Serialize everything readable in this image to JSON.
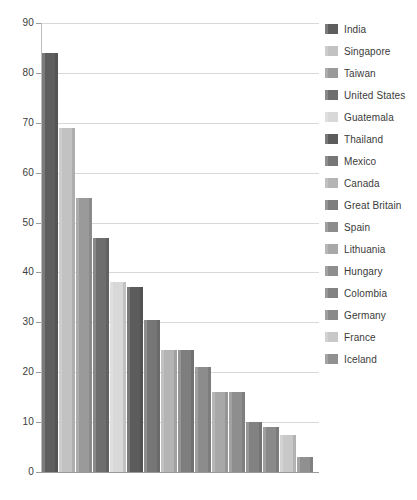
{
  "chart_data": {
    "type": "bar",
    "title": "",
    "subtitle": "",
    "xlabel": "",
    "ylabel": "",
    "ylim": [
      0,
      90
    ],
    "ytick_labels": [
      "90",
      "80",
      "70",
      "60",
      "50",
      "40",
      "30",
      "20",
      "10",
      "0"
    ],
    "yticks": [
      90,
      80,
      70,
      60,
      50,
      40,
      30,
      20,
      10,
      0
    ],
    "grid": true,
    "legend_position": "right",
    "categories": [
      "India",
      "Singapore",
      "Taiwan",
      "United States",
      "Guatemala",
      "Thailand",
      "Mexico",
      "Canada",
      "Great Britain",
      "Spain",
      "Lithuania",
      "Hungary",
      "Colombia",
      "Germany",
      "France",
      "Iceland"
    ],
    "values": [
      84,
      69,
      55,
      47,
      38,
      37,
      30.5,
      24.5,
      24.5,
      21,
      16,
      16,
      10,
      9,
      7.5,
      3
    ],
    "colors": [
      "#5e5e5e",
      "#c2c2c2",
      "#9a9a9a",
      "#6e6e6e",
      "#d8d8d8",
      "#5c5c5c",
      "#767676",
      "#b4b4b4",
      "#7e7e7e",
      "#8c8c8c",
      "#a8a8a8",
      "#8e8e8e",
      "#828282",
      "#8a8a8a",
      "#c8c8c8",
      "#909090"
    ]
  },
  "legend": {
    "items": [
      {
        "label": "India",
        "color": "#5e5e5e"
      },
      {
        "label": "Singapore",
        "color": "#c2c2c2"
      },
      {
        "label": "Taiwan",
        "color": "#9a9a9a"
      },
      {
        "label": "United States",
        "color": "#6e6e6e"
      },
      {
        "label": "Guatemala",
        "color": "#d8d8d8"
      },
      {
        "label": "Thailand",
        "color": "#5c5c5c"
      },
      {
        "label": "Mexico",
        "color": "#767676"
      },
      {
        "label": "Canada",
        "color": "#b4b4b4"
      },
      {
        "label": "Great Britain",
        "color": "#7e7e7e"
      },
      {
        "label": "Spain",
        "color": "#8c8c8c"
      },
      {
        "label": "Lithuania",
        "color": "#a8a8a8"
      },
      {
        "label": "Hungary",
        "color": "#8e8e8e"
      },
      {
        "label": "Colombia",
        "color": "#828282"
      },
      {
        "label": "Germany",
        "color": "#8a8a8a"
      },
      {
        "label": "France",
        "color": "#c8c8c8"
      },
      {
        "label": "Iceland",
        "color": "#909090"
      }
    ]
  },
  "axes": {
    "grid_color": "#d8d8d8",
    "axis_color": "#9a9a9a",
    "tick_text_color": "#3c3c3c"
  }
}
